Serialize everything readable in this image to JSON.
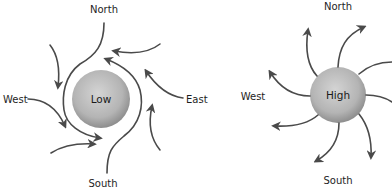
{
  "diagrams": [
    {
      "name": "low-pressure",
      "center_label": "Low",
      "flow": "inward-counterclockwise",
      "directions": {
        "north": "North",
        "west": "West",
        "east": "East",
        "south": "South"
      }
    },
    {
      "name": "high-pressure",
      "center_label": "High",
      "flow": "outward-clockwise",
      "directions": {
        "north": "North",
        "west": "West",
        "south": "South"
      }
    }
  ],
  "colors": {
    "sphere_light": "#d2d2d2",
    "sphere_dark": "#8f8f8f",
    "arrow": "#4a4a4a",
    "text": "#1e1e1e"
  }
}
